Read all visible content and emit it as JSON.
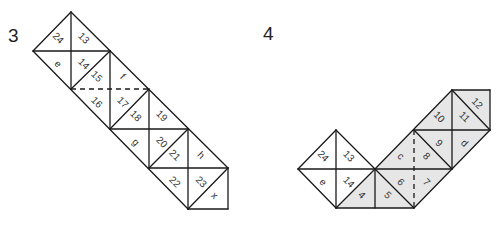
{
  "figures": [
    {
      "number": "3",
      "number_pos": [
        8,
        25
      ],
      "shaded_color": "#ffffff",
      "triangles": [
        {
          "label": "24",
          "pts": [
            [
              33,
              51
            ],
            [
              71,
              12
            ],
            [
              71,
              51
            ]
          ]
        },
        {
          "label": "13",
          "pts": [
            [
              71,
              12
            ],
            [
              71,
              51
            ],
            [
              110,
              51
            ]
          ]
        },
        {
          "label": "e",
          "pts": [
            [
              33,
              51
            ],
            [
              71,
              51
            ],
            [
              71,
              89
            ]
          ]
        },
        {
          "label": "14",
          "pts": [
            [
              71,
              51
            ],
            [
              110,
              51
            ],
            [
              71,
              89
            ]
          ]
        },
        {
          "label": "15",
          "pts": [
            [
              71,
              89
            ],
            [
              110,
              51
            ],
            [
              110,
              89
            ]
          ]
        },
        {
          "label": "f",
          "pts": [
            [
              110,
              51
            ],
            [
              110,
              89
            ],
            [
              149,
              89
            ]
          ]
        },
        {
          "label": "16",
          "pts": [
            [
              71,
              89
            ],
            [
              110,
              89
            ],
            [
              110,
              129
            ]
          ]
        },
        {
          "label": "17",
          "pts": [
            [
              110,
              89
            ],
            [
              149,
              89
            ],
            [
              110,
              129
            ]
          ]
        },
        {
          "label": "18",
          "pts": [
            [
              110,
              129
            ],
            [
              149,
              89
            ],
            [
              149,
              129
            ]
          ]
        },
        {
          "label": "19",
          "pts": [
            [
              149,
              89
            ],
            [
              149,
              129
            ],
            [
              188,
              129
            ]
          ]
        },
        {
          "label": "g",
          "pts": [
            [
              110,
              129
            ],
            [
              149,
              129
            ],
            [
              149,
              168
            ]
          ]
        },
        {
          "label": "20",
          "pts": [
            [
              149,
              129
            ],
            [
              188,
              129
            ],
            [
              149,
              168
            ]
          ]
        },
        {
          "label": "21",
          "pts": [
            [
              149,
              168
            ],
            [
              188,
              129
            ],
            [
              188,
              168
            ]
          ]
        },
        {
          "label": "h",
          "pts": [
            [
              188,
              129
            ],
            [
              188,
              168
            ],
            [
              228,
              168
            ]
          ]
        },
        {
          "label": "22",
          "pts": [
            [
              149,
              168
            ],
            [
              188,
              168
            ],
            [
              188,
              209
            ]
          ]
        },
        {
          "label": "23",
          "pts": [
            [
              188,
              168
            ],
            [
              228,
              168
            ],
            [
              188,
              209
            ]
          ]
        },
        {
          "label": "x",
          "pts": [
            [
              188,
              209
            ],
            [
              228,
              168
            ],
            [
              228,
              209
            ]
          ]
        }
      ],
      "lines": [
        [
          [
            71,
            12
          ],
          [
            228,
            168
          ]
        ],
        [
          [
            33,
            51
          ],
          [
            188,
            209
          ]
        ],
        [
          [
            33,
            51
          ],
          [
            71,
            12
          ]
        ],
        [
          [
            71,
            89
          ],
          [
            110,
            51
          ]
        ],
        [
          [
            110,
            129
          ],
          [
            149,
            89
          ]
        ],
        [
          [
            149,
            168
          ],
          [
            188,
            129
          ]
        ],
        [
          [
            188,
            209
          ],
          [
            228,
            168
          ]
        ],
        [
          [
            33,
            51
          ],
          [
            110,
            51
          ]
        ],
        [
          [
            110,
            129
          ],
          [
            188,
            129
          ]
        ],
        [
          [
            149,
            168
          ],
          [
            228,
            168
          ]
        ],
        [
          [
            188,
            209
          ],
          [
            228,
            209
          ]
        ],
        [
          [
            71,
            12
          ],
          [
            71,
            89
          ]
        ],
        [
          [
            110,
            51
          ],
          [
            110,
            129
          ]
        ],
        [
          [
            149,
            89
          ],
          [
            149,
            168
          ]
        ],
        [
          [
            188,
            129
          ],
          [
            188,
            209
          ]
        ],
        [
          [
            228,
            168
          ],
          [
            228,
            209
          ]
        ]
      ],
      "dashed": [
        [
          [
            71,
            89
          ],
          [
            149,
            89
          ]
        ]
      ]
    },
    {
      "number": "4",
      "number_pos": [
        263,
        23
      ],
      "triangles": [
        {
          "label": "24",
          "pts": [
            [
              298,
              169
            ],
            [
              336,
              130
            ],
            [
              336,
              169
            ]
          ],
          "shaded": false
        },
        {
          "label": "13",
          "pts": [
            [
              336,
              130
            ],
            [
              336,
              169
            ],
            [
              375,
              169
            ]
          ],
          "shaded": false
        },
        {
          "label": "e",
          "pts": [
            [
              298,
              169
            ],
            [
              336,
              169
            ],
            [
              336,
              208
            ]
          ],
          "shaded": false
        },
        {
          "label": "14",
          "pts": [
            [
              336,
              169
            ],
            [
              375,
              169
            ],
            [
              336,
              208
            ]
          ],
          "shaded": false
        },
        {
          "label": "4",
          "pts": [
            [
              336,
              208
            ],
            [
              375,
              169
            ],
            [
              375,
              208
            ]
          ],
          "shaded": true
        },
        {
          "label": "5",
          "pts": [
            [
              375,
              169
            ],
            [
              375,
              208
            ],
            [
              414,
              208
            ]
          ],
          "shaded": true
        },
        {
          "label": "6",
          "pts": [
            [
              375,
              169
            ],
            [
              414,
              169
            ],
            [
              414,
              208
            ]
          ],
          "shaded": true
        },
        {
          "label": "c",
          "pts": [
            [
              375,
              169
            ],
            [
              414,
              130
            ],
            [
              414,
              169
            ]
          ],
          "shaded": true
        },
        {
          "label": "8",
          "pts": [
            [
              414,
              130
            ],
            [
              414,
              169
            ],
            [
              452,
              169
            ]
          ],
          "shaded": true
        },
        {
          "label": "7",
          "pts": [
            [
              414,
              169
            ],
            [
              414,
              208
            ],
            [
              452,
              169
            ]
          ],
          "shaded": true
        },
        {
          "label": "9",
          "pts": [
            [
              414,
              130
            ],
            [
              452,
              130
            ],
            [
              452,
              169
            ]
          ],
          "shaded": true
        },
        {
          "label": "10",
          "pts": [
            [
              414,
              130
            ],
            [
              452,
              90
            ],
            [
              452,
              130
            ]
          ],
          "shaded": true
        },
        {
          "label": "11",
          "pts": [
            [
              452,
              90
            ],
            [
              452,
              130
            ],
            [
              490,
              130
            ]
          ],
          "shaded": true
        },
        {
          "label": "12",
          "pts": [
            [
              452,
              90
            ],
            [
              490,
              90
            ],
            [
              490,
              130
            ]
          ],
          "shaded": true
        },
        {
          "label": "d",
          "pts": [
            [
              452,
              130
            ],
            [
              490,
              130
            ],
            [
              452,
              169
            ]
          ],
          "shaded": true
        }
      ],
      "shaded_color": "#e6e6e6",
      "lines": [
        [
          [
            298,
            169
          ],
          [
            336,
            130
          ]
        ],
        [
          [
            336,
            130
          ],
          [
            375,
            169
          ]
        ],
        [
          [
            298,
            169
          ],
          [
            336,
            208
          ]
        ],
        [
          [
            336,
            208
          ],
          [
            414,
            208
          ]
        ],
        [
          [
            298,
            169
          ],
          [
            452,
            169
          ]
        ],
        [
          [
            336,
            130
          ],
          [
            336,
            208
          ]
        ],
        [
          [
            375,
            169
          ],
          [
            375,
            208
          ]
        ],
        [
          [
            336,
            208
          ],
          [
            375,
            169
          ]
        ],
        [
          [
            375,
            169
          ],
          [
            414,
            208
          ]
        ],
        [
          [
            375,
            169
          ],
          [
            452,
            90
          ]
        ],
        [
          [
            414,
            130
          ],
          [
            452,
            169
          ]
        ],
        [
          [
            414,
            208
          ],
          [
            490,
            130
          ]
        ],
        [
          [
            414,
            130
          ],
          [
            490,
            130
          ]
        ],
        [
          [
            452,
            90
          ],
          [
            452,
            169
          ]
        ],
        [
          [
            452,
            90
          ],
          [
            490,
            90
          ]
        ],
        [
          [
            490,
            90
          ],
          [
            490,
            130
          ]
        ],
        [
          [
            452,
            90
          ],
          [
            490,
            130
          ]
        ]
      ],
      "dashed": [
        [
          [
            414,
            130
          ],
          [
            414,
            208
          ]
        ]
      ]
    }
  ]
}
